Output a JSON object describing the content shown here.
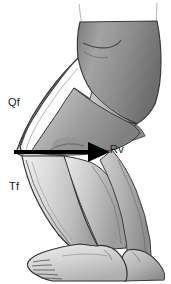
{
  "figure": {
    "background_color": "#ffffff",
    "width": 171,
    "height": 284,
    "labels": {
      "quadriceps_force": "Qf",
      "tibiofemoral_force": "Tf",
      "resultant_vector": "Rv"
    },
    "arrow": {
      "name": "resultant-force-arrow",
      "color": "#000000",
      "direction": "right",
      "start_x": 14,
      "start_y": 152,
      "end_x": 108,
      "end_y": 152
    },
    "palette": {
      "outline": "#2b2b2b",
      "skin_light": "#e6e6e6",
      "skin_mid": "#c2c2c2",
      "skin_shadow": "#9a9a9a",
      "shorts_light": "#b4b4b4",
      "shorts_mid": "#949494",
      "shorts_dark": "#6f6f6f",
      "arrow": "#000000"
    }
  }
}
